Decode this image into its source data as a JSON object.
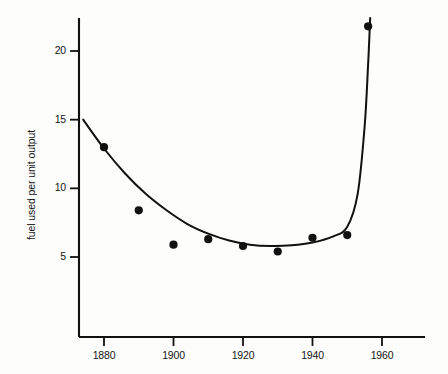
{
  "chart_data": {
    "type": "scatter",
    "title": "",
    "xlabel": "",
    "ylabel": "fuel used per unit output",
    "xlim": [
      1873,
      1966
    ],
    "ylim": [
      2.2,
      23.4
    ],
    "grid": false,
    "legend": null,
    "x_ticks": [
      1880,
      1900,
      1920,
      1940,
      1960
    ],
    "y_ticks": [
      5,
      10,
      15,
      20
    ],
    "x_tick_labels": [
      "1880",
      "1900",
      "1920",
      "1940",
      "1960"
    ],
    "y_tick_labels": [
      "5",
      "10",
      "15",
      "20"
    ],
    "x": [
      1880,
      1890,
      1900,
      1910,
      1920,
      1930,
      1940,
      1950,
      1956
    ],
    "values": [
      13.0,
      8.4,
      5.9,
      6.3,
      5.8,
      5.4,
      6.4,
      6.6,
      21.8
    ],
    "series": [
      {
        "name": "fuel used per unit output",
        "marker": "filled-circle",
        "marker_color": "#111111",
        "x": [
          1880,
          1890,
          1900,
          1910,
          1920,
          1930,
          1940,
          1950,
          1956
        ],
        "values": [
          13.0,
          8.4,
          5.9,
          6.3,
          5.8,
          5.4,
          6.4,
          6.6,
          21.8
        ]
      },
      {
        "name": "fitted curve",
        "marker": "none",
        "line_color": "#111111",
        "x": [
          1874,
          1880,
          1886,
          1892,
          1898,
          1904,
          1910,
          1916,
          1922,
          1928,
          1934,
          1940,
          1946,
          1950,
          1953,
          1955,
          1956,
          1956.6
        ],
        "values": [
          15.0,
          12.9,
          11.1,
          9.6,
          8.4,
          7.4,
          6.7,
          6.2,
          5.9,
          5.8,
          5.85,
          6.05,
          6.5,
          7.2,
          9.6,
          14.5,
          19.0,
          22.4
        ]
      }
    ],
    "axis_color": "#111111",
    "background": "#fdfdfc"
  },
  "axis": {
    "y_label": "fuel used per unit output"
  }
}
